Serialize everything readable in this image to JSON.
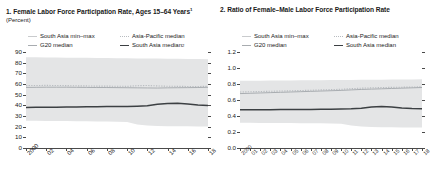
{
  "panels": [
    {
      "title": "1. Female Labor Force Participation Rate, Ages 15–64 Years",
      "title_footnote": "1",
      "subtitle": "(Percent)",
      "legend": [
        {
          "label": "South Asia min–max",
          "style": "band",
          "footnote": ""
        },
        {
          "label": "Asia-Pacific median",
          "style": "apac",
          "footnote": ""
        },
        {
          "label": "G20 median",
          "style": "g20",
          "footnote": ""
        },
        {
          "label": "South Asia median",
          "style": "sa",
          "footnote": "2"
        }
      ],
      "chart_data": {
        "type": "line",
        "title": "1. Female Labor Force Participation Rate, Ages 15–64 Years",
        "xlabel": "",
        "ylabel": "Percent",
        "ylim": [
          0,
          90
        ],
        "yticks": [
          0,
          10,
          20,
          30,
          40,
          50,
          60,
          70,
          80,
          90
        ],
        "grid": false,
        "legend_position": "top",
        "x": [
          2000,
          2001,
          2002,
          2003,
          2004,
          2005,
          2006,
          2007,
          2008,
          2009,
          2010,
          2011,
          2012,
          2013,
          2014,
          2015,
          2016,
          2017,
          2018
        ],
        "xticklabels": [
          "2000",
          "02",
          "04",
          "06",
          "08",
          "10",
          "12",
          "14",
          "16",
          "18"
        ],
        "xtick_values": [
          2000,
          2002,
          2004,
          2006,
          2008,
          2010,
          2012,
          2014,
          2016,
          2018
        ],
        "band": {
          "name": "South Asia min–max",
          "min": [
            25.5,
            25.5,
            25.4,
            25.3,
            25.2,
            25.1,
            25.0,
            24.9,
            24.8,
            24.6,
            24.4,
            22.0,
            21.0,
            20.6,
            20.4,
            20.3,
            20.3,
            20.2,
            20.2
          ],
          "max": [
            85.0,
            85.0,
            84.9,
            84.8,
            84.7,
            84.6,
            84.5,
            84.4,
            84.3,
            84.2,
            84.1,
            84.0,
            83.9,
            83.8,
            83.7,
            83.6,
            83.5,
            83.4,
            83.3
          ]
        },
        "series": [
          {
            "name": "Asia-Pacific median",
            "style": "dotted",
            "values": [
              58.5,
              58.6,
              58.7,
              58.6,
              58.5,
              58.3,
              58.2,
              58.0,
              58.0,
              57.9,
              57.8,
              58.4,
              58.6,
              58.2,
              57.9,
              57.8,
              57.7,
              57.7,
              57.8
            ]
          },
          {
            "name": "G20 median",
            "style": "solid-light",
            "values": [
              56.8,
              56.9,
              57.0,
              57.0,
              57.0,
              56.9,
              56.8,
              56.7,
              56.7,
              56.6,
              56.5,
              56.4,
              56.3,
              56.2,
              56.4,
              56.5,
              56.6,
              56.7,
              56.9
            ]
          },
          {
            "name": "South Asia median",
            "style": "solid-dark",
            "values": [
              38.0,
              38.1,
              38.2,
              38.3,
              38.4,
              38.5,
              38.6,
              38.7,
              38.8,
              38.9,
              39.0,
              39.2,
              39.6,
              41.0,
              41.8,
              41.9,
              41.2,
              40.3,
              39.9
            ]
          }
        ]
      }
    },
    {
      "title": "2. Ratio of Female–Male Labor Force Participation Rate",
      "title_footnote": "",
      "subtitle": "",
      "legend": [
        {
          "label": "South Asia min–max",
          "style": "band",
          "footnote": ""
        },
        {
          "label": "Asia-Pacific median",
          "style": "apac",
          "footnote": ""
        },
        {
          "label": "G20 median",
          "style": "g20",
          "footnote": ""
        },
        {
          "label": "South Asia median",
          "style": "sa",
          "footnote": ""
        }
      ],
      "chart_data": {
        "type": "line",
        "title": "2. Ratio of Female–Male Labor Force Participation Rate",
        "xlabel": "",
        "ylabel": "",
        "ylim": [
          0.0,
          1.2
        ],
        "yticks": [
          "0.0",
          "0.2",
          "0.4",
          "0.6",
          "0.8",
          "1.0",
          "1.2"
        ],
        "ytick_values": [
          0.0,
          0.2,
          0.4,
          0.6,
          0.8,
          1.0,
          1.2
        ],
        "grid": false,
        "legend_position": "top",
        "x": [
          2000,
          2001,
          2002,
          2003,
          2004,
          2005,
          2006,
          2007,
          2008,
          2009,
          2010,
          2011,
          2012,
          2013,
          2014,
          2015,
          2016,
          2017,
          2018
        ],
        "xticklabels": [
          "2000",
          "01",
          "02",
          "03",
          "04",
          "05",
          "06",
          "07",
          "08",
          "09",
          "10",
          "11",
          "12",
          "13",
          "14",
          "15",
          "16",
          "17",
          "18"
        ],
        "xtick_values": [
          2000,
          2001,
          2002,
          2003,
          2004,
          2005,
          2006,
          2007,
          2008,
          2009,
          2010,
          2011,
          2012,
          2013,
          2014,
          2015,
          2016,
          2017,
          2018
        ],
        "band": {
          "name": "South Asia min–max",
          "min": [
            0.315,
            0.315,
            0.314,
            0.313,
            0.312,
            0.311,
            0.31,
            0.309,
            0.308,
            0.306,
            0.304,
            0.28,
            0.268,
            0.262,
            0.259,
            0.258,
            0.257,
            0.256,
            0.256
          ],
          "max": [
            0.84,
            0.841,
            0.842,
            0.843,
            0.844,
            0.845,
            0.846,
            0.847,
            0.848,
            0.849,
            0.85,
            0.851,
            0.852,
            0.853,
            0.854,
            0.855,
            0.856,
            0.857,
            0.858
          ]
        },
        "series": [
          {
            "name": "Asia-Pacific median",
            "style": "dotted",
            "values": [
              0.7,
              0.703,
              0.706,
              0.709,
              0.712,
              0.715,
              0.718,
              0.722,
              0.726,
              0.73,
              0.734,
              0.742,
              0.748,
              0.752,
              0.756,
              0.758,
              0.76,
              0.762,
              0.765
            ]
          },
          {
            "name": "G20 median",
            "style": "solid-light",
            "values": [
              0.68,
              0.684,
              0.688,
              0.692,
              0.696,
              0.7,
              0.704,
              0.708,
              0.712,
              0.716,
              0.72,
              0.726,
              0.732,
              0.736,
              0.74,
              0.744,
              0.748,
              0.752,
              0.756
            ]
          },
          {
            "name": "South Asia median",
            "style": "solid-dark",
            "values": [
              0.478,
              0.478,
              0.479,
              0.479,
              0.48,
              0.48,
              0.481,
              0.482,
              0.483,
              0.484,
              0.486,
              0.49,
              0.497,
              0.512,
              0.52,
              0.512,
              0.5,
              0.494,
              0.492
            ]
          }
        ]
      }
    }
  ]
}
